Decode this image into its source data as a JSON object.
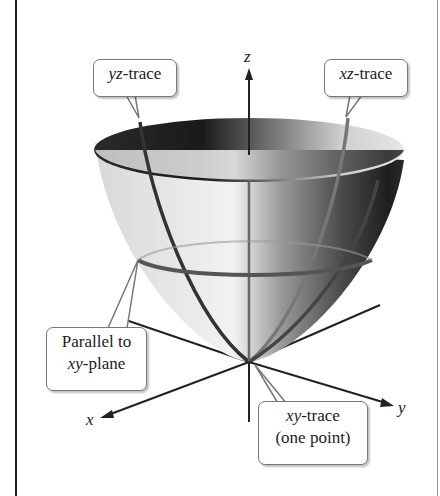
{
  "figure": {
    "axes": {
      "x": "x",
      "y": "y",
      "z": "z"
    },
    "callouts": {
      "yz_trace": {
        "var": "yz",
        "suffix": "-trace"
      },
      "xz_trace": {
        "var": "xz",
        "suffix": "-trace"
      },
      "parallel": {
        "line1": "Parallel to",
        "var": "xy",
        "suffix": "-plane"
      },
      "xy_trace": {
        "var": "xy",
        "suffix": "-trace",
        "line2": "(one point)"
      }
    },
    "colors": {
      "trace_line": "#555555",
      "axis": "#222222",
      "surface_dark": "#1a1a1a",
      "surface_light": "#e8e8e8"
    }
  }
}
